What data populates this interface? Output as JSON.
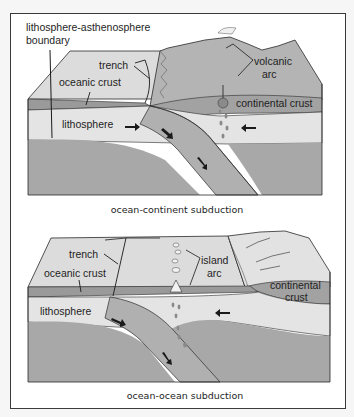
{
  "figure": {
    "panels": [
      {
        "id": "ocean-continent",
        "caption": "ocean-continent subduction",
        "labels": {
          "boundary_line1": "lithosphere-asthenosphere",
          "boundary_line2": "boundary",
          "trench": "trench",
          "oceanic_crust": "oceanic crust",
          "lithosphere": "lithosphere",
          "volcanic_line1": "volcanic",
          "volcanic_line2": "arc",
          "continental_crust": "continental crust"
        }
      },
      {
        "id": "ocean-ocean",
        "caption": "ocean-ocean subduction",
        "labels": {
          "trench": "trench",
          "oceanic_crust": "oceanic crust",
          "lithosphere": "lithosphere",
          "island_line1": "island",
          "island_line2": "arc",
          "continental_line1": "continental",
          "continental_line2": "crust"
        }
      }
    ],
    "colors": {
      "surface_light": "#dcdcdc",
      "crust_dark": "#9a9a9a",
      "lithosphere": "#e4e4e4",
      "asthenosphere": "#a8a8a8",
      "continent": "#b4b4b4",
      "slab": "#b0b0b0",
      "outline": "#2a2a2a"
    }
  }
}
